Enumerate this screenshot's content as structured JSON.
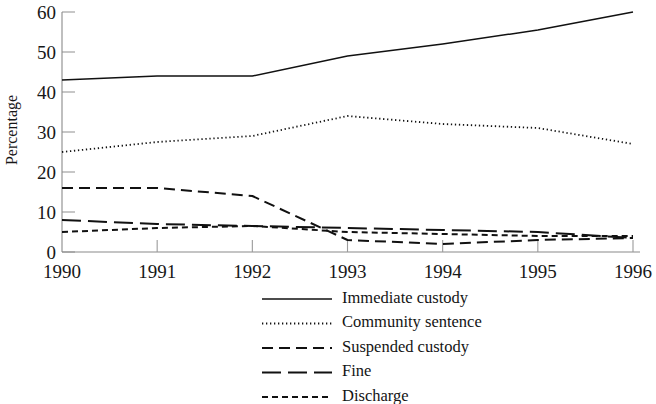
{
  "chart_data": {
    "type": "line",
    "title": "",
    "xlabel": "",
    "ylabel": "Percentage",
    "x": [
      1990,
      1991,
      1992,
      1993,
      1994,
      1995,
      1996
    ],
    "xtick_labels": [
      "1990",
      "1991",
      "1992",
      "1993",
      "1994",
      "1995",
      "1996"
    ],
    "ytick_labels": [
      "0",
      "10",
      "20",
      "30",
      "40",
      "50",
      "60"
    ],
    "yticks": [
      0,
      10,
      20,
      30,
      40,
      50,
      60
    ],
    "ylim": [
      0,
      60
    ],
    "xlim": [
      1990,
      1996
    ],
    "grid": false,
    "legend_position": "bottom-center",
    "series": [
      {
        "name": "Immediate custody",
        "linestyle": "solid",
        "color": "#111111",
        "values": [
          43,
          44,
          44,
          49,
          52,
          55.5,
          60
        ]
      },
      {
        "name": "Community sentence",
        "linestyle": "dotted",
        "color": "#111111",
        "values": [
          25,
          27.5,
          29,
          34,
          32,
          31,
          27
        ]
      },
      {
        "name": "Suspended custody",
        "linestyle": "dashed",
        "color": "#111111",
        "values": [
          16,
          16,
          14,
          3,
          2,
          3,
          3.5
        ]
      },
      {
        "name": "Fine",
        "linestyle": "long-dash",
        "color": "#111111",
        "values": [
          8,
          7,
          6.5,
          6,
          5.5,
          5,
          3.5
        ]
      },
      {
        "name": "Discharge",
        "linestyle": "short-dash",
        "color": "#111111",
        "values": [
          5,
          6,
          6.5,
          5,
          4.5,
          4,
          4
        ]
      }
    ]
  },
  "legend": {
    "entries": [
      {
        "label": "Immediate custody",
        "dash": "none",
        "width": 1.5
      },
      {
        "label": "Community sentence",
        "dash": "1.3,2.7",
        "width": 1.8
      },
      {
        "label": "Suspended custody",
        "dash": "11,6",
        "width": 2.0
      },
      {
        "label": "Fine",
        "dash": "19,7",
        "width": 2.0
      },
      {
        "label": "Discharge",
        "dash": "6,4",
        "width": 2.0
      }
    ]
  },
  "style": {
    "axis_color": "#8a8a8a",
    "line_color": "#111111",
    "text_color": "#171717",
    "background": "#ffffff"
  }
}
